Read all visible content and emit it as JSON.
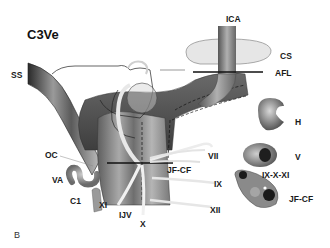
{
  "figure": {
    "title": "C3Ve",
    "panel_letter": "B",
    "labels": {
      "ica": "ICA",
      "cs": "CS",
      "afl": "AFL",
      "ss": "SS",
      "h": "H",
      "oc": "OC",
      "vii": "VII",
      "jf_cf_main": "JF-CF",
      "v": "V",
      "va": "VA",
      "ix": "IX",
      "ix_x_xi": "IX-X-XI",
      "c1": "C1",
      "xi": "XI",
      "ijv": "IJV",
      "x": "X",
      "xii": "XII",
      "jf_cf_section": "JF-CF"
    },
    "colors": {
      "vessel_dark": "#3a3a3a",
      "vessel_mid": "#8a8a8a",
      "vessel_light": "#d8d8d8",
      "cavernous_sinus_fill": "#e4e4e4",
      "nerve": "#efefef",
      "line": "#111111"
    }
  }
}
